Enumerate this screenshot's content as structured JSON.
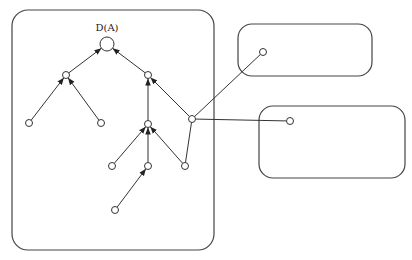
{
  "diagram": {
    "root_label": "D(A)",
    "containers": [
      {
        "id": "main",
        "x": 12,
        "y": 10,
        "w": 202,
        "h": 240,
        "r": 16
      },
      {
        "id": "top-right",
        "x": 238,
        "y": 24,
        "w": 134,
        "h": 52,
        "r": 14
      },
      {
        "id": "bottom-right",
        "x": 259,
        "y": 106,
        "w": 146,
        "h": 72,
        "r": 14
      }
    ],
    "nodes": [
      {
        "id": "root",
        "x": 107,
        "y": 44,
        "r": 7
      },
      {
        "id": "l2a",
        "x": 66,
        "y": 75,
        "r": 3.5
      },
      {
        "id": "l2b",
        "x": 148,
        "y": 75,
        "r": 3.5
      },
      {
        "id": "l3a",
        "x": 29,
        "y": 123,
        "r": 3.5
      },
      {
        "id": "l3b",
        "x": 101,
        "y": 123,
        "r": 3.5
      },
      {
        "id": "l3c",
        "x": 148,
        "y": 124,
        "r": 3.5
      },
      {
        "id": "hub",
        "x": 192,
        "y": 119,
        "r": 3.5
      },
      {
        "id": "l4a",
        "x": 112,
        "y": 166,
        "r": 3.5
      },
      {
        "id": "l4b",
        "x": 148,
        "y": 166,
        "r": 3.5
      },
      {
        "id": "l4c",
        "x": 185,
        "y": 166,
        "r": 3.5
      },
      {
        "id": "l5a",
        "x": 115,
        "y": 210,
        "r": 3.5
      },
      {
        "id": "ext1",
        "x": 263,
        "y": 52,
        "r": 3.5
      },
      {
        "id": "ext2",
        "x": 290,
        "y": 121,
        "r": 3.5
      }
    ],
    "edges": [
      {
        "from": "l2a",
        "to": "root",
        "arrow": true
      },
      {
        "from": "l2b",
        "to": "root",
        "arrow": true
      },
      {
        "from": "l3a",
        "to": "l2a",
        "arrow": true
      },
      {
        "from": "l3b",
        "to": "l2a",
        "arrow": true
      },
      {
        "from": "l3c",
        "to": "l2b",
        "arrow": true
      },
      {
        "from": "hub",
        "to": "l2b",
        "arrow": true
      },
      {
        "from": "l4a",
        "to": "l3c",
        "arrow": true
      },
      {
        "from": "l4b",
        "to": "l3c",
        "arrow": true
      },
      {
        "from": "l4c",
        "to": "l3c",
        "arrow": true
      },
      {
        "from": "l5a",
        "to": "l4b",
        "arrow": true
      },
      {
        "from": "l4c",
        "to": "hub",
        "arrow": false
      },
      {
        "from": "hub",
        "to": "ext1",
        "arrow": false
      },
      {
        "from": "hub",
        "to": "ext2",
        "arrow": false
      }
    ]
  }
}
